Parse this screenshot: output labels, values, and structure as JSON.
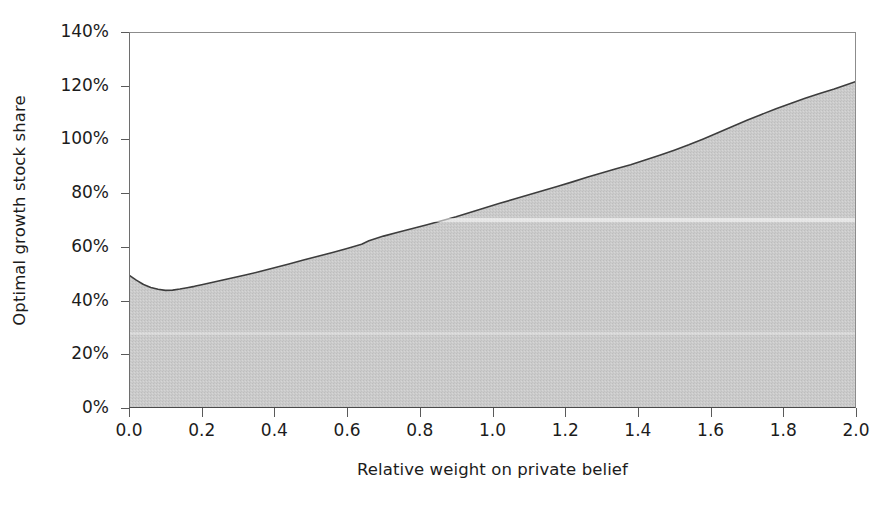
{
  "chart_data": {
    "type": "area",
    "title": "",
    "xlabel": "Relative weight on private belief",
    "ylabel": "Optimal growth stock share",
    "xlim": [
      0.0,
      2.0
    ],
    "ylim": [
      0.0,
      1.4
    ],
    "grid": false,
    "legend": null,
    "xticks": [
      "0.0",
      "0.2",
      "0.4",
      "0.6",
      "0.8",
      "1.0",
      "1.2",
      "1.4",
      "1.6",
      "1.8",
      "2.0"
    ],
    "xtick_values": [
      0.0,
      0.2,
      0.4,
      0.6,
      0.8,
      1.0,
      1.2,
      1.4,
      1.6,
      1.8,
      2.0
    ],
    "yticks": [
      "0%",
      "20%",
      "40%",
      "60%",
      "80%",
      "100%",
      "120%",
      "140%"
    ],
    "ytick_values": [
      0,
      20,
      40,
      60,
      80,
      100,
      120,
      140
    ],
    "series": [
      {
        "name": "Optimal growth stock share",
        "fill_color": "#c9c9c9",
        "line_color": "#3d3d3d",
        "x": [
          0.0,
          0.02,
          0.04,
          0.06,
          0.08,
          0.1,
          0.12,
          0.14,
          0.16,
          0.18,
          0.2,
          0.24,
          0.28,
          0.32,
          0.36,
          0.4,
          0.44,
          0.48,
          0.52,
          0.56,
          0.6,
          0.64,
          0.66,
          0.7,
          0.74,
          0.78,
          0.82,
          0.86,
          0.9,
          0.94,
          0.98,
          1.02,
          1.06,
          1.1,
          1.14,
          1.18,
          1.22,
          1.26,
          1.3,
          1.34,
          1.38,
          1.42,
          1.46,
          1.5,
          1.54,
          1.58,
          1.62,
          1.66,
          1.7,
          1.74,
          1.78,
          1.82,
          1.86,
          1.9,
          1.94,
          1.97,
          2.0
        ],
        "values": [
          49.5,
          47.6,
          46.0,
          44.9,
          44.2,
          43.8,
          43.9,
          44.3,
          44.8,
          45.3,
          45.9,
          47.1,
          48.3,
          49.5,
          50.8,
          52.2,
          53.6,
          55.1,
          56.5,
          57.9,
          59.4,
          61.0,
          62.3,
          64.0,
          65.4,
          66.8,
          68.2,
          69.7,
          71.2,
          72.9,
          74.6,
          76.2,
          77.8,
          79.4,
          81.0,
          82.6,
          84.2,
          85.9,
          87.5,
          89.1,
          90.6,
          92.3,
          94.1,
          96.0,
          98.0,
          100.2,
          102.5,
          104.8,
          107.1,
          109.3,
          111.4,
          113.4,
          115.3,
          117.1,
          118.8,
          120.2,
          121.6
        ],
        "units": "percent"
      }
    ]
  },
  "axes": {
    "y_title": "Optimal growth stock share",
    "x_title": "Relative weight on private belief"
  }
}
